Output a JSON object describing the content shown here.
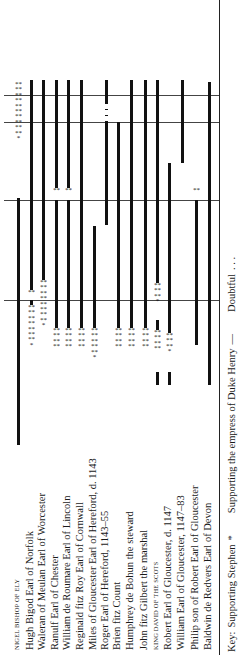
{
  "chart_data": {
    "type": "timeline",
    "orientation": "rotated 90° counter-clockwise (names read bottom-to-top, time runs upward)",
    "title": "",
    "key": {
      "label": "Key:",
      "supporting_stephen": "Supporting Stephen",
      "supporting_stephen_symbol": "*",
      "supporting_empress": "Supporting the empress of Duke Henry",
      "supporting_empress_symbol": "—",
      "doubtful": "Doubtful",
      "doubtful_symbol": ". . ."
    },
    "reference_lines_y": [
      95,
      122,
      200,
      300
    ],
    "rows": [
      {
        "name": "NIGEL BISHOP OF ELY",
        "small_caps": true,
        "x": 18,
        "segments": [
          {
            "type": "stephen",
            "from": 82,
            "to": 198
          },
          {
            "type": "empress",
            "from": 198,
            "to": 445
          }
        ]
      },
      {
        "name": "Hugh Bigod Earl of Norfolk",
        "x": 31,
        "segments": [
          {
            "type": "empress",
            "from": 80,
            "to": 290
          },
          {
            "type": "stephen",
            "from": 290,
            "to": 300
          },
          {
            "type": "empress",
            "from": 300,
            "to": 305
          },
          {
            "type": "stephen",
            "from": 305,
            "to": 385
          }
        ]
      },
      {
        "name": "Waleran of Meulan Earl of Worcester",
        "x": 43,
        "segments": [
          {
            "type": "empress",
            "from": 80,
            "to": 280
          },
          {
            "type": "stephen",
            "from": 280,
            "to": 370
          }
        ]
      },
      {
        "name": "Ranulf Earl of Chester",
        "x": 56,
        "segments": [
          {
            "type": "empress",
            "from": 80,
            "to": 188
          },
          {
            "type": "stephen",
            "from": 188,
            "to": 200
          },
          {
            "type": "empress",
            "from": 200,
            "to": 328
          },
          {
            "type": "stephen",
            "from": 328,
            "to": 370
          }
        ]
      },
      {
        "name": "William de Roumare Earl of Lincoln",
        "x": 68,
        "segments": [
          {
            "type": "empress",
            "from": 80,
            "to": 188
          },
          {
            "type": "stephen",
            "from": 188,
            "to": 200
          },
          {
            "type": "empress",
            "from": 200,
            "to": 328
          },
          {
            "type": "stephen",
            "from": 328,
            "to": 370
          }
        ]
      },
      {
        "name": "Reginald fitz Roy Earl of Cornwall",
        "x": 81,
        "segments": [
          {
            "type": "empress",
            "from": 80,
            "to": 328
          },
          {
            "type": "stephen",
            "from": 328,
            "to": 370
          }
        ]
      },
      {
        "name": "Miles of Gloucester Earl of Hereford, d. 1143",
        "x": 94,
        "segments": [
          {
            "type": "empress",
            "from": 226,
            "to": 328
          },
          {
            "type": "stephen",
            "from": 328,
            "to": 385
          }
        ]
      },
      {
        "name": "Roger Earl of Hereford, 1143–55",
        "x": 106,
        "segments": [
          {
            "type": "empress",
            "from": 80,
            "to": 103
          },
          {
            "type": "doubtful",
            "from": 103,
            "to": 122
          },
          {
            "type": "empress",
            "from": 122,
            "to": 225
          }
        ]
      },
      {
        "name": "Brien fitz Count",
        "x": 118,
        "segments": [
          {
            "type": "empress",
            "from": 122,
            "to": 328
          },
          {
            "type": "stephen",
            "from": 328,
            "to": 370
          }
        ]
      },
      {
        "name": "Humphrey de Bohun the steward",
        "x": 131,
        "segments": [
          {
            "type": "empress",
            "from": 80,
            "to": 328
          },
          {
            "type": "stephen",
            "from": 328,
            "to": 370
          }
        ]
      },
      {
        "name": "John fitz Gilbert the marshal",
        "x": 145,
        "segments": [
          {
            "type": "empress",
            "from": 80,
            "to": 328
          },
          {
            "type": "stephen",
            "from": 328,
            "to": 370
          }
        ]
      },
      {
        "name": "KING DAVID OF THE SCOTS",
        "small_caps": true,
        "x": 157,
        "segments": [
          {
            "type": "empress",
            "from": 80,
            "to": 283
          },
          {
            "type": "stephen",
            "from": 283,
            "to": 320
          },
          {
            "type": "empress",
            "from": 320,
            "to": 330
          },
          {
            "type": "stephen",
            "from": 330,
            "to": 372
          },
          {
            "type": "empress",
            "from": 372,
            "to": 385
          }
        ]
      },
      {
        "name": "Robert Earl of Gloucester, d. 1147",
        "x": 169,
        "segments": [
          {
            "type": "empress",
            "from": 163,
            "to": 333
          },
          {
            "type": "stephen",
            "from": 333,
            "to": 372
          },
          {
            "type": "empress",
            "from": 372,
            "to": 385
          }
        ]
      },
      {
        "name": "William Earl of Gloucester, 1147–83",
        "x": 182,
        "segments": [
          {
            "type": "empress",
            "from": 80,
            "to": 163
          }
        ]
      },
      {
        "name": "Philip son of Robert Earl of Gloucester",
        "x": 196,
        "segments": [
          {
            "type": "stephen",
            "from": 188,
            "to": 200
          },
          {
            "type": "empress",
            "from": 200,
            "to": 345
          }
        ]
      },
      {
        "name": "Baldwin de Redvers Earl of Devon",
        "x": 209,
        "segments": [
          {
            "type": "empress",
            "from": 82,
            "to": 385
          }
        ]
      }
    ]
  }
}
